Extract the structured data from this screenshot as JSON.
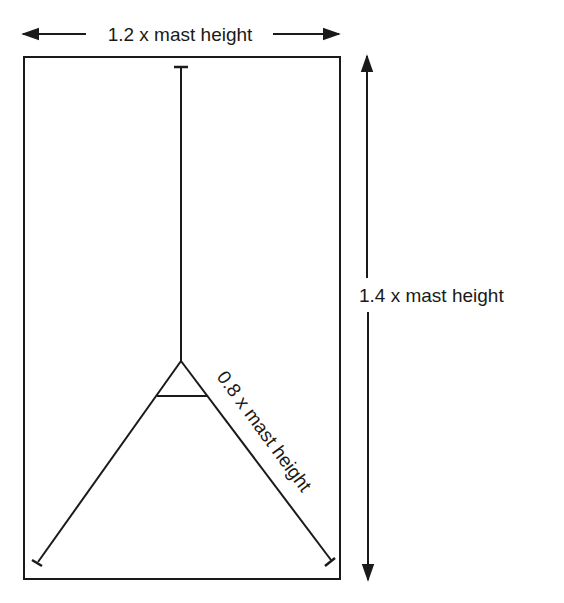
{
  "diagram": {
    "type": "antenna-layout",
    "labels": {
      "width": "1.2 x mast height",
      "height": "1.4 x mast height",
      "leg": "0.8 x mast height"
    },
    "colors": {
      "line": "#1a1a1a",
      "background": "#ffffff"
    }
  }
}
